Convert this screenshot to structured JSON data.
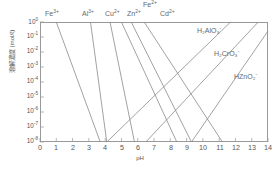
{
  "chart_data": {
    "type": "line",
    "title": "",
    "xlabel": "pH",
    "ylabel": "溶解濃度 (mol/ℓ)",
    "xlim": [
      0,
      14
    ],
    "ylim_exponents": [
      -8,
      0
    ],
    "grid": false,
    "legend_position": "inline-annotations",
    "line_color": "#8a8a8a",
    "axis_color": "#999999",
    "text_color": "#555555",
    "xticks": [
      "0",
      "1",
      "2",
      "3",
      "4",
      "5",
      "6",
      "7",
      "8",
      "9",
      "10",
      "11",
      "12",
      "13",
      "14"
    ],
    "yticks": [
      {
        "mantissa": "10",
        "exp": "0"
      },
      {
        "mantissa": "10",
        "exp": "-1"
      },
      {
        "mantissa": "10",
        "exp": "-2"
      },
      {
        "mantissa": "10",
        "exp": "-3"
      },
      {
        "mantissa": "10",
        "exp": "-4"
      },
      {
        "mantissa": "10",
        "exp": "-5"
      },
      {
        "mantissa": "10",
        "exp": "-6"
      },
      {
        "mantissa": "10",
        "exp": "-7"
      },
      {
        "mantissa": "10",
        "exp": "-8"
      }
    ],
    "series": [
      {
        "name": "Fe3+",
        "label_base": "Fe",
        "label_sup": "3+",
        "direction": "descending",
        "points": [
          {
            "x": 1.0,
            "y_exp": 0
          },
          {
            "x": 3.7,
            "y_exp": -8
          }
        ]
      },
      {
        "name": "Al3+",
        "label_base": "Al",
        "label_sup": "3+",
        "direction": "descending",
        "points": [
          {
            "x": 3.1,
            "y_exp": 0
          },
          {
            "x": 4.1,
            "y_exp": -8
          }
        ]
      },
      {
        "name": "Cu2+",
        "label_base": "Cu",
        "label_sup": "2+",
        "direction": "descending",
        "points": [
          {
            "x": 4.3,
            "y_exp": 0
          },
          {
            "x": 5.8,
            "y_exp": -8
          }
        ]
      },
      {
        "name": "Zn2+",
        "label_base": "Zn",
        "label_sup": "2+",
        "direction": "descending",
        "points": [
          {
            "x": 5.0,
            "y_exp": 0
          },
          {
            "x": 8.4,
            "y_exp": -8
          }
        ]
      },
      {
        "name": "Fe2+",
        "label_base": "Fe",
        "label_sup": "2+",
        "direction": "descending",
        "points": [
          {
            "x": 5.6,
            "y_exp": 0
          },
          {
            "x": 9.3,
            "y_exp": -8
          }
        ]
      },
      {
        "name": "Cd2+",
        "label_base": "Cd",
        "label_sup": "2+",
        "direction": "descending",
        "points": [
          {
            "x": 6.4,
            "y_exp": 0
          },
          {
            "x": 11.2,
            "y_exp": -8
          }
        ]
      },
      {
        "name": "H2AlO3-",
        "label_base": "H",
        "label_sub": "2",
        "label_mid": "AlO",
        "label_sub2": "3",
        "label_sup": "-",
        "direction": "ascending",
        "points": [
          {
            "x": 4.1,
            "y_exp": -8
          },
          {
            "x": 11.7,
            "y_exp": 0
          }
        ]
      },
      {
        "name": "H2CrO3-",
        "label_base": "H",
        "label_sub": "2",
        "label_mid": "CrO",
        "label_sub2": "3",
        "label_sup": "-",
        "direction": "ascending",
        "points": [
          {
            "x": 6.5,
            "y_exp": -8
          },
          {
            "x": 13.4,
            "y_exp": 0
          }
        ]
      },
      {
        "name": "HZnO2-",
        "label_base": "H",
        "label_mid": "ZnO",
        "label_sub2": "2",
        "label_sup": "-",
        "direction": "ascending",
        "points": [
          {
            "x": 9.3,
            "y_exp": -8
          },
          {
            "x": 14.0,
            "y_exp": -0.6
          }
        ]
      }
    ],
    "annotations": [
      {
        "id": "ann-fe3",
        "text": "Fe",
        "sup": "3+",
        "x": 45,
        "y": 10
      },
      {
        "id": "ann-al3",
        "text": "Al",
        "sup": "3+",
        "x": 82,
        "y": 10
      },
      {
        "id": "ann-cu2",
        "text": "Cu",
        "sup": "2+",
        "x": 105,
        "y": 10
      },
      {
        "id": "ann-zn2",
        "text": "Zn",
        "sup": "2+",
        "x": 127,
        "y": 10
      },
      {
        "id": "ann-fe2",
        "text": "Fe",
        "sup": "2+",
        "x": 143,
        "y": 1
      },
      {
        "id": "ann-cd2",
        "text": "Cd",
        "sup": "2+",
        "x": 160,
        "y": 10
      },
      {
        "id": "ann-h2alo3",
        "text": "H₂AlO₃",
        "sup": "-",
        "x": 197,
        "y": 27
      },
      {
        "id": "ann-h2cro3",
        "text": "H₂CrO₃",
        "sup": "-",
        "x": 214,
        "y": 50
      },
      {
        "id": "ann-hzno2",
        "text": "HZnO₂",
        "sup": "-",
        "x": 234,
        "y": 73
      }
    ]
  }
}
